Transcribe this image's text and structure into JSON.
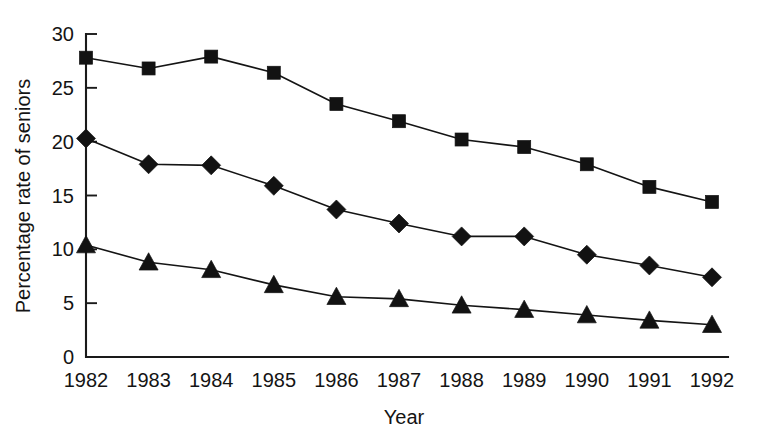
{
  "chart_data": {
    "type": "line",
    "title": "",
    "subtitle": "",
    "xlabel": "Year",
    "ylabel": "Percentage rate of seniors",
    "categories": [
      "1982",
      "1983",
      "1984",
      "1985",
      "1986",
      "1987",
      "1988",
      "1989",
      "1990",
      "1991",
      "1992"
    ],
    "x": [
      1982,
      1983,
      1984,
      1985,
      1986,
      1987,
      1988,
      1989,
      1990,
      1991,
      1992
    ],
    "xlim": [
      1982,
      1992
    ],
    "ylim": [
      0,
      30
    ],
    "ytick_labels": [
      "0",
      "5",
      "10",
      "15",
      "20",
      "25",
      "30"
    ],
    "yticks": [
      0,
      5,
      10,
      15,
      20,
      25,
      30
    ],
    "grid": false,
    "legend": "none",
    "series": [
      {
        "name": "Series 1",
        "marker": "square",
        "color": "#121212",
        "values": [
          27.8,
          26.8,
          27.9,
          26.4,
          23.5,
          21.9,
          20.2,
          19.5,
          17.9,
          15.8,
          14.4
        ]
      },
      {
        "name": "Series 2",
        "marker": "diamond",
        "color": "#121212",
        "values": [
          20.3,
          17.9,
          17.8,
          15.9,
          13.7,
          12.4,
          11.2,
          11.2,
          9.5,
          8.5,
          7.4
        ]
      },
      {
        "name": "Series 3",
        "marker": "triangle",
        "color": "#121212",
        "values": [
          10.4,
          8.8,
          8.1,
          6.7,
          5.6,
          5.4,
          4.8,
          4.4,
          3.9,
          3.4,
          3.0
        ]
      }
    ],
    "annotations": []
  },
  "axes": {
    "x_axis_title": "Year",
    "y_axis_title": "Percentage rate of seniors"
  }
}
